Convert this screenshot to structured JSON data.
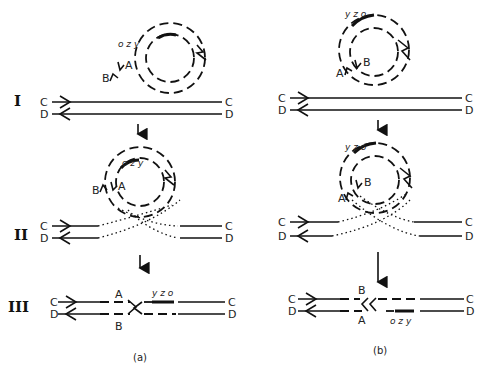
{
  "stages": {
    "stage1": "I",
    "stage2": "II",
    "stage3": "III"
  },
  "panels": {
    "a": {
      "caption": "(a)"
    },
    "b": {
      "caption": "(b)"
    }
  },
  "strand_labels": {
    "C": "C",
    "D": "D",
    "A": "A",
    "B": "B"
  },
  "genes": {
    "a_circle": "o z y",
    "a_final": "y z o",
    "b_circle": "y z o",
    "b_final": "o z y",
    "o": "o",
    "z": "z",
    "y": "y"
  },
  "colors": {
    "ink": "#111111",
    "background": "#ffffff"
  }
}
